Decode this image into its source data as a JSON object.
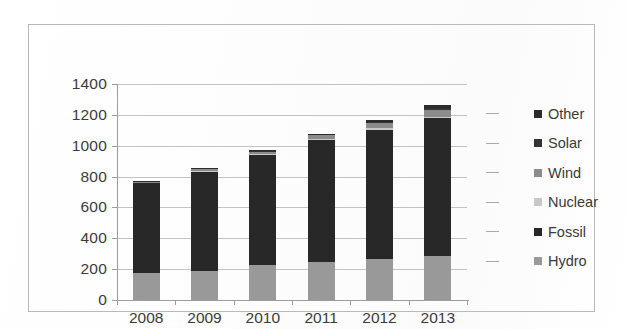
{
  "chart_data": {
    "type": "bar",
    "subtype": "stacked-bar",
    "title": "",
    "xlabel": "",
    "ylabel": "",
    "categories": [
      "2008",
      "2009",
      "2010",
      "2011",
      "2012",
      "2013"
    ],
    "ylim": [
      0,
      1400
    ],
    "ytick_step": 200,
    "yticks": [
      0,
      200,
      400,
      600,
      800,
      1000,
      1200,
      1400
    ],
    "ytick_labels": [
      "0",
      "200",
      "400",
      "600",
      "800",
      "1000",
      "1200",
      "1400"
    ],
    "grid": true,
    "legend_position": "right",
    "stack_order_bottom_to_top": [
      "Hydro",
      "Fossil",
      "Nuclear",
      "Wind",
      "Solar",
      "Other"
    ],
    "series": [
      {
        "name": "Other",
        "color": "#2b2b2b",
        "values": [
          4,
          4,
          5,
          6,
          8,
          22
        ]
      },
      {
        "name": "Solar",
        "color": "#333333",
        "values": [
          1,
          2,
          3,
          5,
          8,
          12
        ]
      },
      {
        "name": "Wind",
        "color": "#8c8c8c",
        "values": [
          6,
          10,
          16,
          24,
          34,
          44
        ]
      },
      {
        "name": "Nuclear",
        "color": "#c8c8c8",
        "values": [
          5,
          6,
          7,
          9,
          10,
          12
        ]
      },
      {
        "name": "Fossil",
        "color": "#282828",
        "values": [
          582,
          648,
          715,
          790,
          840,
          892
        ]
      },
      {
        "name": "Hydro",
        "color": "#999999",
        "values": [
          175,
          185,
          225,
          245,
          265,
          285
        ]
      }
    ],
    "totals": [
      773,
      855,
      971,
      1079,
      1165,
      1267
    ],
    "bar_tops": [
      {
        "category": "2008",
        "total": 773
      },
      {
        "category": "2009",
        "total": 855
      },
      {
        "category": "2010",
        "total": 971
      },
      {
        "category": "2011",
        "total": 1079
      },
      {
        "category": "2012",
        "total": 1165
      },
      {
        "category": "2013",
        "total": 1267
      }
    ]
  },
  "legend": {
    "items": [
      {
        "label": "Other",
        "color": "#2b2b2b"
      },
      {
        "label": "Solar",
        "color": "#333333"
      },
      {
        "label": "Wind",
        "color": "#8c8c8c"
      },
      {
        "label": "Nuclear",
        "color": "#c8c8c8"
      },
      {
        "label": "Fossil",
        "color": "#282828"
      },
      {
        "label": "Hydro",
        "color": "#999999"
      }
    ]
  },
  "axes": {
    "y_tick_labels": [
      "1400",
      "1200",
      "1000",
      "800",
      "600",
      "400",
      "200",
      "0"
    ],
    "x_tick_labels": [
      "2008",
      "2009",
      "2010",
      "2011",
      "2012",
      "2013"
    ]
  },
  "colors": {
    "frame_border": "#b9b9b9",
    "gridline": "#c3c3c3",
    "axis": "#9d9d9d",
    "text": "#3b3b3b",
    "background": "#ffffff"
  }
}
